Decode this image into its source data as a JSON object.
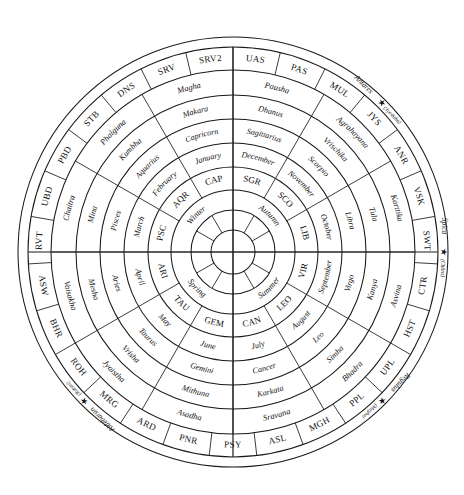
{
  "figure": {
    "type": "circular-zodiac-calendar-wheel",
    "center": {
      "x": 233,
      "y": 252
    },
    "background": "#ffffff",
    "stroke_color": "#1a1a1a"
  },
  "chart_data": {
    "type": "pie",
    "title": "",
    "rings": [
      {
        "name": "nakshatra_abbrev",
        "index": 7,
        "count": 27,
        "r_inner": 182,
        "r_outer": 205,
        "style": "abbr",
        "start_angle_deg": -90,
        "labels": [
          "UAS",
          "PAS",
          "MUL",
          "JYS",
          "ANR",
          "VSK",
          "SWT",
          "CTR",
          "HST",
          "UPL",
          "PPL",
          "MGH",
          "ASL",
          "PSY",
          "PNR",
          "ARD",
          "MRG",
          "ROH",
          "BHR",
          "ASW",
          "RVT",
          "UBD",
          "PBD",
          "STB",
          "DNS",
          "SRV",
          "SRV2"
        ]
      },
      {
        "name": "hindu_month",
        "index": 6,
        "count": 12,
        "r_inner": 157,
        "r_outer": 182,
        "style": "italic",
        "start_angle_deg": -90,
        "labels": [
          "Pausha",
          "Agrahayana",
          "Karttika",
          "Asvina",
          "Bhadra",
          "Sravana",
          "Asadha",
          "Jyaistha",
          "Vaisakha",
          "Chaitra",
          "Phalguna",
          "Magha"
        ]
      },
      {
        "name": "rashi",
        "index": 5,
        "count": 12,
        "r_inner": 133,
        "r_outer": 157,
        "style": "italic",
        "start_angle_deg": -90,
        "labels": [
          "Dhanus",
          "Vrischika",
          "Tula",
          "Kanya",
          "Simha",
          "Karkata",
          "Mithuna",
          "Vrisha",
          "Mesha",
          "Mina",
          "Kumbha",
          "Makara"
        ]
      },
      {
        "name": "zodiac_sign",
        "index": 4,
        "count": 12,
        "r_inner": 109,
        "r_outer": 133,
        "style": "italic",
        "start_angle_deg": -90,
        "labels": [
          "Sagittarius",
          "Scorpio",
          "Libra",
          "Virgo",
          "Leo",
          "Cancer",
          "Gemini",
          "Taurus",
          "Aries",
          "Pisces",
          "Aquarius",
          "Capricorn"
        ]
      },
      {
        "name": "gregorian_month",
        "index": 3,
        "count": 12,
        "r_inner": 85,
        "r_outer": 109,
        "style": "italic",
        "start_angle_deg": -90,
        "labels": [
          "December",
          "November",
          "October",
          "September",
          "August",
          "July",
          "June",
          "May",
          "April",
          "March",
          "February",
          "January"
        ]
      },
      {
        "name": "sign_abbrev",
        "index": 2,
        "count": 12,
        "r_inner": 62,
        "r_outer": 85,
        "style": "abbr",
        "start_angle_deg": -90,
        "labels": [
          "SGR",
          "SCO",
          "LIB",
          "VIR",
          "LEO",
          "CAN",
          "GEM",
          "TAU",
          "ARI",
          "PSC",
          "AQR",
          "CAP"
        ]
      },
      {
        "name": "season",
        "index": 1,
        "count": 4,
        "r_inner": 42,
        "r_outer": 62,
        "style": "italic",
        "start_angle_deg": -90,
        "labels": [
          "Autumn",
          "Summer",
          "Spring",
          "Winter"
        ]
      },
      {
        "name": "inner_twelve",
        "index": 0,
        "count": 12,
        "r_inner": 22,
        "r_outer": 42,
        "style": "blank",
        "start_angle_deg": -90,
        "labels": [
          "",
          "",
          "",
          "",
          "",
          "",
          "",
          "",
          "",
          "",
          "",
          ""
        ]
      },
      {
        "name": "core_quadrants",
        "index": -1,
        "count": 4,
        "r_inner": 0,
        "r_outer": 22,
        "style": "blank",
        "start_angle_deg": -90,
        "labels": [
          "",
          "",
          "",
          ""
        ]
      }
    ],
    "outer_band": {
      "name": "star_band",
      "r_inner": 205,
      "r_outer": 215,
      "note": "plain annulus carrying four bright-star markers"
    },
    "stars": [
      {
        "name": "Antares",
        "nakshatra": "(Jyeshtha)",
        "angle_deg": -45,
        "glyph": "star-marker"
      },
      {
        "name": "Spica",
        "nakshatra": "(Chitra)",
        "angle_deg": 0,
        "glyph": "star-marker"
      },
      {
        "name": "Regulus",
        "nakshatra": "(Magha)",
        "angle_deg": 45,
        "glyph": "star-marker"
      },
      {
        "name": "Aldebaran",
        "nakshatra": "(Rohini)",
        "angle_deg": 135,
        "glyph": "star-marker"
      }
    ]
  },
  "nakshatra_full": {
    "UAS": "Uttara Ashadha",
    "PAS": "Purva Ashadha",
    "MUL": "Mula",
    "JYS": "Jyeshtha",
    "ANR": "Anuradha",
    "VSK": "Vishakha",
    "SWT": "Swati",
    "CTR": "Chitra",
    "HST": "Hasta",
    "UPL": "Uttara Phalguni",
    "PPL": "Purva Phalguni",
    "MGH": "Magha",
    "ASL": "Ashlesha",
    "PSY": "Pushya",
    "PNR": "Punarvasu",
    "ARD": "Ardra",
    "MRG": "Mrigashira",
    "ROH": "Rohini",
    "BHR": "Bharani",
    "ASW": "Ashwini",
    "RVT": "Revati",
    "UBD": "Uttara Bhadrapada",
    "PBD": "Purva Bhadrapada",
    "STB": "Shatabhisha",
    "DNS": "Dhanishta",
    "SRV": "Shravana"
  }
}
